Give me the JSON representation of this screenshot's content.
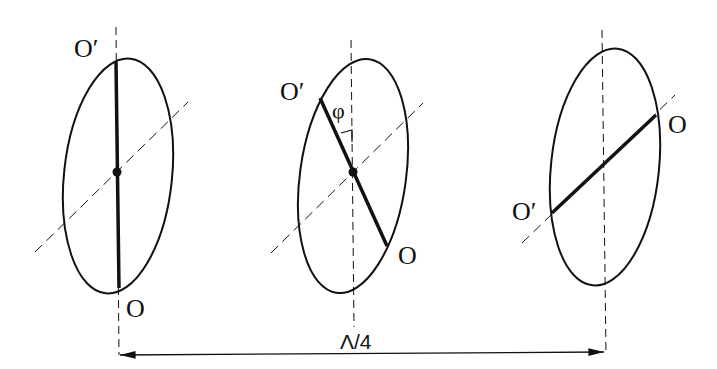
{
  "diagram": {
    "type": "polarization-ellipse-sequence",
    "stroke_color": "#111111",
    "background": "#ffffff",
    "panels": [
      {
        "id": "left",
        "label_top": "O′",
        "label_bottom": "O",
        "axis_orientation": "vertical"
      },
      {
        "id": "middle",
        "label_top": "O′",
        "label_bottom": "O",
        "angle_label": "φ",
        "axis_orientation": "tilted"
      },
      {
        "id": "right",
        "label_top": "O",
        "label_bottom": "O′",
        "axis_orientation": "diagonal"
      }
    ],
    "dimension": {
      "label": "Λ/4"
    }
  }
}
